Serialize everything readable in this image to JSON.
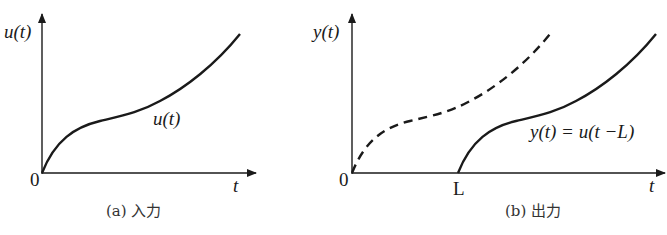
{
  "panels": [
    {
      "id": "a",
      "y_axis_label": "u(t)",
      "x_axis_label": "t",
      "origin_label": "0",
      "curve_label": "u(t)",
      "caption": "(a) 入力"
    },
    {
      "id": "b",
      "y_axis_label": "y(t)",
      "x_axis_label": "t",
      "origin_label": "0",
      "delay_label": "L",
      "curve_label": "y(t) = u(t −L)",
      "caption": "(b) 出力"
    }
  ],
  "colors": {
    "line": "#1a1a1a",
    "background": "#ffffff"
  }
}
